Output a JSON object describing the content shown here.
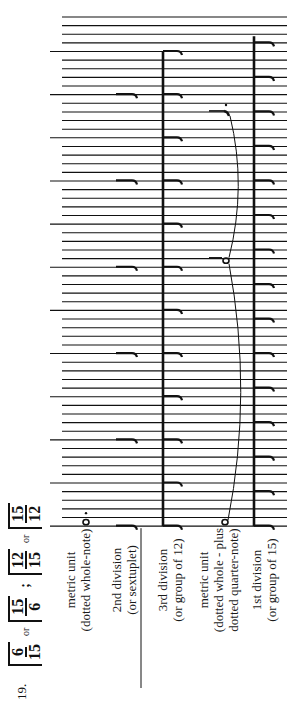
{
  "example": {
    "number": "19.",
    "time_signatures": [
      {
        "num": "6",
        "den": "15"
      },
      {
        "sep": "or"
      },
      {
        "num": "15",
        "den": "6"
      },
      {
        "sep": ";"
      },
      {
        "num": "12",
        "den": "15"
      },
      {
        "sep": "or"
      },
      {
        "num": "15",
        "den": "12"
      }
    ]
  },
  "labels": [
    {
      "lines": [
        "metric unit",
        "(dotted whole-note)"
      ]
    },
    {
      "lines": [
        "2nd division",
        "(or sextuplet)"
      ]
    },
    {
      "lines": [
        "3rd division",
        "(or group of 12)"
      ]
    },
    {
      "lines": [
        "metric unit",
        "(dotted whole - plus",
        "dotted quarter-note)"
      ]
    },
    {
      "lines": [
        "1st division",
        "(or group of 15)"
      ]
    }
  ],
  "staff": {
    "line_count": 60,
    "first_y": 17,
    "spacing": 8.63,
    "x_end": 287,
    "x_start_short": 62,
    "x_start_long": 50,
    "long_every": 5
  },
  "colors": {
    "ink": "#111111",
    "paper": "#ffffff"
  }
}
